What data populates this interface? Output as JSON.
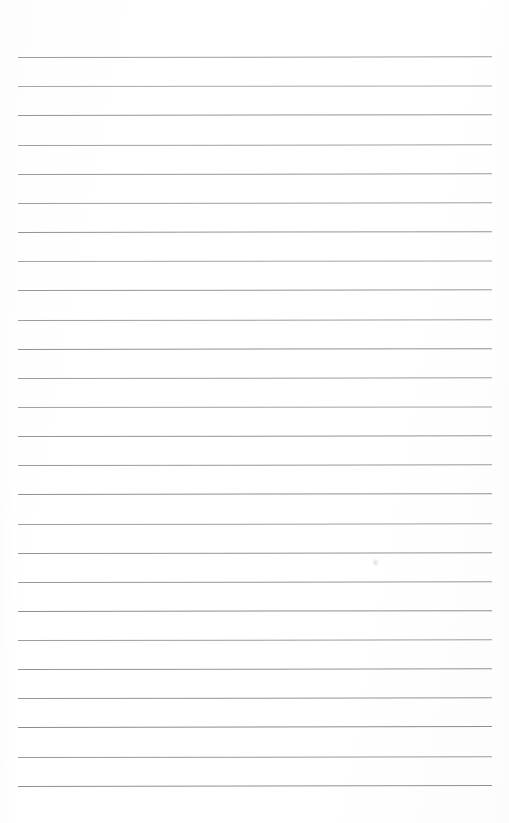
{
  "document": {
    "kind": "scanned-lined-paper",
    "title": "Blank Ruled Notebook Page",
    "width": 509,
    "height": 823,
    "background_color": "#fefefe",
    "page_text": "",
    "has_handwriting": false,
    "has_margin_rule": false,
    "orientation": "portrait"
  },
  "ruling": {
    "line_count": 26,
    "line_color": "#8a8a8a",
    "line_thickness_px": 1,
    "first_line_y": 57,
    "line_spacing_px": 29.1,
    "line_left_x": 18,
    "line_right_x": 492,
    "line_length_px": 474,
    "top_margin_px": 57,
    "bottom_margin_px": 37,
    "left_margin_px": 18,
    "right_margin_px": 17
  },
  "lines": [
    {
      "index": 1,
      "y": 57,
      "color": "#8d8d8d",
      "opacity": 0.88,
      "tilt_deg": -0.09
    },
    {
      "index": 2,
      "y": 86,
      "color": "#949494",
      "opacity": 0.82,
      "tilt_deg": -0.07
    },
    {
      "index": 3,
      "y": 115,
      "color": "#8a8a8a",
      "opacity": 0.9,
      "tilt_deg": -0.1
    },
    {
      "index": 4,
      "y": 145,
      "color": "#909090",
      "opacity": 0.85,
      "tilt_deg": -0.08
    },
    {
      "index": 5,
      "y": 174,
      "color": "#8c8c8c",
      "opacity": 0.89,
      "tilt_deg": -0.09
    },
    {
      "index": 6,
      "y": 203,
      "color": "#8f8f8f",
      "opacity": 0.86,
      "tilt_deg": -0.08
    },
    {
      "index": 7,
      "y": 232,
      "color": "#898989",
      "opacity": 0.91,
      "tilt_deg": -0.1
    },
    {
      "index": 8,
      "y": 261,
      "color": "#939393",
      "opacity": 0.83,
      "tilt_deg": -0.07
    },
    {
      "index": 9,
      "y": 290,
      "color": "#8b8b8b",
      "opacity": 0.89,
      "tilt_deg": -0.09
    },
    {
      "index": 10,
      "y": 320,
      "color": "#8e8e8e",
      "opacity": 0.86,
      "tilt_deg": -0.08
    },
    {
      "index": 11,
      "y": 349,
      "color": "#888888",
      "opacity": 0.92,
      "tilt_deg": -0.1
    },
    {
      "index": 12,
      "y": 378,
      "color": "#8d8d8d",
      "opacity": 0.88,
      "tilt_deg": -0.09
    },
    {
      "index": 13,
      "y": 407,
      "color": "#919191",
      "opacity": 0.84,
      "tilt_deg": -0.07
    },
    {
      "index": 14,
      "y": 436,
      "color": "#8a8a8a",
      "opacity": 0.9,
      "tilt_deg": -0.09
    },
    {
      "index": 15,
      "y": 465,
      "color": "#8c8c8c",
      "opacity": 0.88,
      "tilt_deg": -0.08
    },
    {
      "index": 16,
      "y": 494,
      "color": "#878787",
      "opacity": 0.92,
      "tilt_deg": -0.1
    },
    {
      "index": 17,
      "y": 524,
      "color": "#8f8f8f",
      "opacity": 0.86,
      "tilt_deg": -0.08
    },
    {
      "index": 18,
      "y": 553,
      "color": "#898989",
      "opacity": 0.91,
      "tilt_deg": -0.09
    },
    {
      "index": 19,
      "y": 582,
      "color": "#8b8b8b",
      "opacity": 0.89,
      "tilt_deg": -0.09
    },
    {
      "index": 20,
      "y": 611,
      "color": "#868686",
      "opacity": 0.93,
      "tilt_deg": -0.1
    },
    {
      "index": 21,
      "y": 640,
      "color": "#8e8e8e",
      "opacity": 0.87,
      "tilt_deg": -0.08
    },
    {
      "index": 22,
      "y": 669,
      "color": "#888888",
      "opacity": 0.91,
      "tilt_deg": -0.09
    },
    {
      "index": 23,
      "y": 698,
      "color": "#8a8a8a",
      "opacity": 0.9,
      "tilt_deg": -0.09
    },
    {
      "index": 24,
      "y": 727,
      "color": "#858585",
      "opacity": 0.94,
      "tilt_deg": -0.11
    },
    {
      "index": 25,
      "y": 757,
      "color": "#8c8c8c",
      "opacity": 0.88,
      "tilt_deg": -0.09
    },
    {
      "index": 26,
      "y": 786,
      "color": "#878787",
      "opacity": 0.92,
      "tilt_deg": -0.12
    }
  ],
  "artifacts": [
    {
      "name": "faint-smudge",
      "x": 372,
      "y": 558,
      "width": 7,
      "height": 9
    }
  ]
}
